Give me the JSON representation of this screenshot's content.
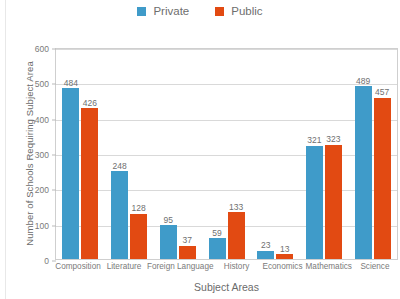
{
  "chart_data": {
    "type": "bar",
    "title": "",
    "xlabel": "Subject Areas",
    "ylabel": "Number of Schools Requiring Subject Area",
    "categories": [
      "Composition",
      "Literature",
      "Foreign Language",
      "History",
      "Economics",
      "Mathematics",
      "Science"
    ],
    "series": [
      {
        "name": "Private",
        "color": "#3f9bc9",
        "values": [
          484,
          248,
          95,
          59,
          23,
          321,
          489
        ]
      },
      {
        "name": "Public",
        "color": "#e24a12",
        "values": [
          426,
          128,
          37,
          133,
          13,
          323,
          457
        ]
      }
    ],
    "ylim": [
      0,
      600
    ],
    "yticks": [
      0,
      100,
      200,
      300,
      400,
      500,
      600
    ],
    "ytick_labels": [
      "0",
      "100",
      "200",
      "300",
      "400",
      "500",
      "600"
    ],
    "grid": true,
    "legend_position": "top-center",
    "data_labels": true
  },
  "legend": {
    "items": [
      {
        "label": "Private",
        "color": "#3f9bc9"
      },
      {
        "label": "Public",
        "color": "#e24a12"
      }
    ]
  },
  "axes": {
    "y_title": "Number of Schools Requiring Subject Area",
    "x_title": "Subject Areas"
  }
}
